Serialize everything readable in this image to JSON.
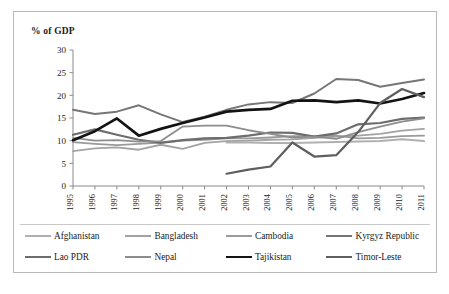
{
  "chart_data": {
    "type": "line",
    "title": "% of GDP",
    "xlabel": "",
    "ylabel": "% of GDP",
    "xlim": [
      1995,
      2011
    ],
    "ylim": [
      0,
      30
    ],
    "ytick_step": 5,
    "grid": false,
    "legend_position": "bottom",
    "x": [
      1995,
      1996,
      1997,
      1998,
      1999,
      2000,
      2001,
      2002,
      2003,
      2004,
      2005,
      2006,
      2007,
      2008,
      2009,
      2010,
      2011
    ],
    "categories": [
      "1995",
      "1996",
      "1997",
      "1998",
      "1999",
      "2000",
      "2001",
      "2002",
      "2003",
      "2004",
      "2005",
      "2006",
      "2007",
      "2008",
      "2009",
      "2010",
      "2011"
    ],
    "yticks": [
      "0",
      "5",
      "10",
      "15",
      "20",
      "25",
      "30"
    ],
    "series": [
      {
        "name": "Afghanistan",
        "color": "#b0b0b0",
        "width": 2.0,
        "values": [
          null,
          null,
          null,
          null,
          null,
          null,
          null,
          9.6,
          9.6,
          9.5,
          9.5,
          9.6,
          9.7,
          9.8,
          9.9,
          10.3,
          9.9
        ]
      },
      {
        "name": "Bangladesh",
        "color": "#a3a3a3",
        "width": 1.8,
        "values": [
          7.7,
          8.3,
          8.5,
          8.0,
          9.1,
          8.2,
          9.5,
          9.9,
          10.0,
          10.2,
          10.3,
          10.6,
          10.9,
          11.1,
          11.5,
          12.2,
          12.6
        ]
      },
      {
        "name": "Cambodia",
        "color": "#9a9a9a",
        "width": 1.8,
        "values": [
          9.7,
          9.3,
          9.0,
          9.3,
          9.6,
          10.0,
          10.2,
          10.5,
          10.5,
          10.7,
          11.0,
          11.0,
          11.1,
          10.5,
          10.6,
          11.0,
          11.1
        ]
      },
      {
        "name": "Kyrgyz Republic",
        "color": "#767676",
        "width": 2.0,
        "values": [
          16.8,
          15.9,
          16.4,
          17.8,
          15.8,
          14.1,
          15.3,
          16.8,
          18.0,
          18.5,
          18.3,
          20.4,
          23.6,
          23.4,
          21.9,
          22.7,
          23.5
        ]
      },
      {
        "name": "Lao PDR",
        "color": "#6d6d6d",
        "width": 2.2,
        "values": [
          11.3,
          12.5,
          11.3,
          10.2,
          9.5,
          10.1,
          10.5,
          10.6,
          11.1,
          11.8,
          11.7,
          10.9,
          11.6,
          13.6,
          13.9,
          14.8,
          15.1
        ]
      },
      {
        "name": "Nepal",
        "color": "#8d8d8d",
        "width": 1.8,
        "values": [
          10.6,
          10.0,
          10.1,
          9.8,
          9.9,
          13.1,
          13.3,
          13.3,
          12.3,
          11.5,
          10.7,
          10.9,
          10.4,
          11.9,
          13.1,
          14.2,
          14.9
        ]
      },
      {
        "name": "Tajikistan",
        "color": "#131313",
        "width": 2.7,
        "values": [
          10.1,
          12.1,
          14.9,
          11.1,
          12.6,
          13.9,
          15.1,
          16.4,
          16.8,
          17.0,
          18.8,
          18.9,
          18.5,
          18.9,
          18.2,
          19.2,
          20.5
        ]
      },
      {
        "name": "Timor-Leste",
        "color": "#5e5e5e",
        "width": 2.2,
        "values": [
          null,
          null,
          null,
          null,
          null,
          null,
          null,
          2.7,
          3.6,
          4.3,
          9.6,
          6.5,
          6.8,
          11.9,
          18.3,
          21.4,
          19.6
        ]
      }
    ]
  },
  "legend": {
    "items": [
      {
        "label": "Afghanistan"
      },
      {
        "label": "Bangladesh"
      },
      {
        "label": "Cambodia"
      },
      {
        "label": "Kyrgyz Republic"
      },
      {
        "label": "Lao PDR"
      },
      {
        "label": "Nepal"
      },
      {
        "label": "Tajikistan"
      },
      {
        "label": "Timor-Leste"
      }
    ]
  }
}
